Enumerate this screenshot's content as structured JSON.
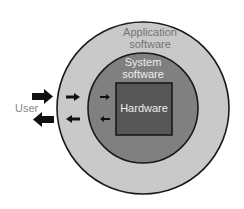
{
  "diagram": {
    "title": "",
    "layers": [
      {
        "id": "application",
        "label_lines": [
          "Application",
          "software"
        ],
        "fill": "#c9c9c9",
        "text_color": "#747474"
      },
      {
        "id": "system",
        "label_lines": [
          "System",
          "software"
        ],
        "fill": "#808080",
        "text_color": "#eeeeee"
      },
      {
        "id": "hardware",
        "label_lines": [
          "Hardware"
        ],
        "fill": "#575757",
        "text_color": "#eeeeee"
      }
    ],
    "user": {
      "label": "User",
      "text_color": "#8a8a8a"
    },
    "arrows": {
      "inbound_direction": "toward hardware",
      "outbound_direction": "toward user",
      "color": "#111111"
    },
    "outline_color": "#1a1a1a"
  }
}
